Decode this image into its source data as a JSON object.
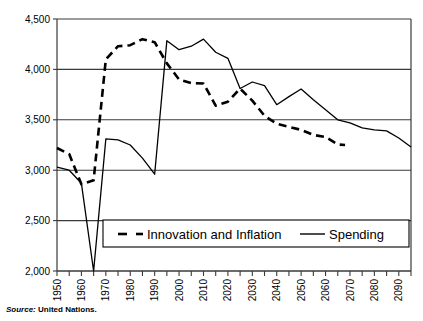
{
  "figure": {
    "cropped_title": "Figure: Population projections",
    "source_keyword": "Source:",
    "source_text": " United Nations."
  },
  "legend": {
    "position": "inside-bottom-center",
    "entries": [
      {
        "label": "Innovation and Inflation",
        "style": "dashed",
        "color": "#000000"
      },
      {
        "label": "Spending",
        "style": "solid",
        "color": "#000000"
      }
    ]
  },
  "axis": {
    "y_ticks": [
      "2,000",
      "2,500",
      "3,000",
      "3,500",
      "4,000",
      "4,500"
    ],
    "x_ticks": [
      "1950",
      "1960",
      "1970",
      "1980",
      "1990",
      "2000",
      "2010",
      "2020",
      "2030",
      "2040",
      "2050",
      "2060",
      "2070",
      "2080",
      "2090"
    ]
  },
  "chart_data": {
    "type": "line",
    "title": "",
    "subtitle": "",
    "xlabel": "",
    "ylabel": "",
    "xlim": [
      1950,
      2095
    ],
    "ylim": [
      2000,
      4500
    ],
    "ytick_step": 500,
    "xtick_step": 10,
    "xminor_step": 5,
    "grid": "horizontal",
    "legend_position": "inside-bottom-center",
    "annotations": [],
    "series": [
      {
        "name": "Innovation and Inflation",
        "style": "dashed",
        "color": "#000000",
        "x": [
          1950,
          1955,
          1960,
          1965,
          1970,
          1975,
          1980,
          1985,
          1990,
          1995,
          2000,
          2005,
          2010,
          2015,
          2020,
          2025,
          2030,
          2035,
          2040,
          2045,
          2050,
          2055,
          2060,
          2065,
          2068
        ],
        "values": [
          3220,
          3160,
          2860,
          2900,
          4100,
          4230,
          4240,
          4300,
          4270,
          4060,
          3900,
          3865,
          3860,
          3640,
          3680,
          3810,
          3690,
          3540,
          3460,
          3430,
          3400,
          3350,
          3330,
          3255,
          3250
        ]
      },
      {
        "name": "Spending",
        "style": "solid",
        "color": "#000000",
        "x": [
          1950,
          1955,
          1960,
          1965,
          1970,
          1975,
          1980,
          1985,
          1990,
          1995,
          2000,
          2005,
          2010,
          2015,
          2020,
          2025,
          2030,
          2035,
          2040,
          2045,
          2050,
          2055,
          2060,
          2065,
          2070,
          2075,
          2080,
          2085,
          2090,
          2095
        ],
        "values": [
          3030,
          3000,
          2870,
          2000,
          3310,
          3300,
          3250,
          3120,
          2960,
          4285,
          4195,
          4230,
          4300,
          4170,
          4110,
          3810,
          3875,
          3840,
          3650,
          3730,
          3805,
          3700,
          3600,
          3500,
          3470,
          3420,
          3400,
          3390,
          3320,
          3230
        ]
      }
    ]
  }
}
